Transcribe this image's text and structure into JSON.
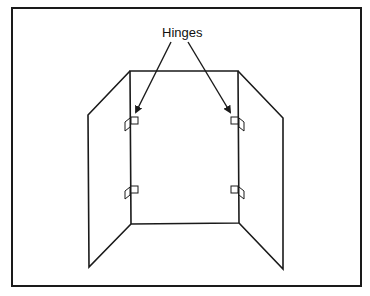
{
  "diagram": {
    "type": "three-panel folding screen",
    "annotation": {
      "label": "Hinges",
      "arrow_count": 2
    },
    "panels": [
      {
        "name": "left-panel"
      },
      {
        "name": "center-panel"
      },
      {
        "name": "right-panel"
      }
    ],
    "hinges": [
      {
        "side": "left",
        "position": "upper"
      },
      {
        "side": "left",
        "position": "lower"
      },
      {
        "side": "right",
        "position": "upper"
      },
      {
        "side": "right",
        "position": "lower"
      }
    ],
    "colors": {
      "line": "#1a1a1a",
      "background": "#ffffff"
    }
  }
}
